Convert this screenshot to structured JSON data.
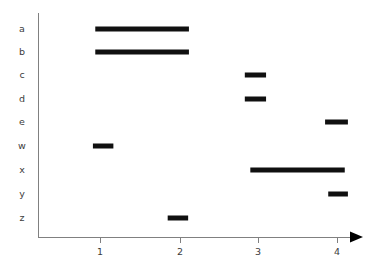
{
  "chart_data": {
    "type": "bar",
    "orientation": "horizontal",
    "title": "",
    "subtitle": "",
    "xlabel": "",
    "ylabel": "",
    "grid": false,
    "legend": null,
    "legend_position": "none",
    "bar_color": "#101010",
    "axis_color": "#808080",
    "label_color": "#3c3c3c",
    "xlim": [
      0.52,
      4.25
    ],
    "xticks": [
      1,
      2,
      3,
      4
    ],
    "xtick_labels": [
      "1",
      "2",
      "3",
      "4"
    ],
    "categories": [
      "a",
      "b",
      "c",
      "d",
      "e",
      "w",
      "x",
      "y",
      "z"
    ],
    "bars": [
      {
        "category": "a",
        "start": 0.94,
        "end": 2.13,
        "length": 1.19
      },
      {
        "category": "b",
        "start": 0.94,
        "end": 2.13,
        "length": 1.19
      },
      {
        "category": "c",
        "start": 2.84,
        "end": 3.11,
        "length": 0.27
      },
      {
        "category": "d",
        "start": 2.84,
        "end": 3.11,
        "length": 0.27
      },
      {
        "category": "e",
        "start": 3.86,
        "end": 4.15,
        "length": 0.29
      },
      {
        "category": "w",
        "start": 0.91,
        "end": 1.17,
        "length": 0.26
      },
      {
        "category": "x",
        "start": 2.91,
        "end": 4.11,
        "length": 1.2
      },
      {
        "category": "y",
        "start": 3.9,
        "end": 4.15,
        "length": 0.25
      },
      {
        "category": "z",
        "start": 1.86,
        "end": 2.12,
        "length": 0.26
      }
    ]
  },
  "geometry": {
    "axis_x": 38,
    "axis_top": 13,
    "axis_bottom": 237,
    "axis_right": 352,
    "arrow_tip": 363,
    "tick_px": [
      100,
      180,
      258,
      337
    ],
    "row_px": [
      29,
      52,
      75,
      99,
      122,
      146,
      170,
      194,
      218
    ],
    "unit_px": 78.7,
    "origin_value": 1,
    "bar_thickness": 5,
    "tick_len": 6,
    "xlabel_y": 252,
    "ylabel_x": 22
  }
}
